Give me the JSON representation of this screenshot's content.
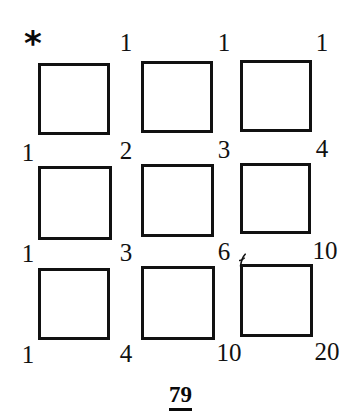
{
  "figure": {
    "caption": "79",
    "marker": "*",
    "marker_icon": "asterisk-icon",
    "grid": {
      "rows": 3,
      "columns": 3,
      "squares": [
        {
          "id": "square-r1c1",
          "x": 38,
          "y": 63,
          "size": 72
        },
        {
          "id": "square-r1c2",
          "x": 141,
          "y": 61,
          "size": 72
        },
        {
          "id": "square-r1c3",
          "x": 240,
          "y": 60,
          "size": 72
        },
        {
          "id": "square-r2c1",
          "x": 38,
          "y": 166,
          "size": 74
        },
        {
          "id": "square-r2c2",
          "x": 141,
          "y": 164,
          "size": 73
        },
        {
          "id": "square-r2c3",
          "x": 240,
          "y": 163,
          "size": 71
        },
        {
          "id": "square-r3c1",
          "x": 38,
          "y": 268,
          "size": 72
        },
        {
          "id": "square-r3c2",
          "x": 141,
          "y": 266,
          "size": 74
        },
        {
          "id": "square-r3c3",
          "x": 240,
          "y": 264,
          "size": 73
        }
      ]
    },
    "labels": [
      {
        "id": "label-r0c1",
        "text": "1",
        "x": 126,
        "y": 42
      },
      {
        "id": "label-r0c2",
        "text": "1",
        "x": 224,
        "y": 42
      },
      {
        "id": "label-r0c3",
        "text": "1",
        "x": 322,
        "y": 42
      },
      {
        "id": "label-r1c0",
        "text": "1",
        "x": 28,
        "y": 152
      },
      {
        "id": "label-r1c1",
        "text": "2",
        "x": 126,
        "y": 150
      },
      {
        "id": "label-r1c2",
        "text": "3",
        "x": 224,
        "y": 149
      },
      {
        "id": "label-r1c3",
        "text": "4",
        "x": 322,
        "y": 148
      },
      {
        "id": "label-r2c0",
        "text": "1",
        "x": 28,
        "y": 253
      },
      {
        "id": "label-r2c1",
        "text": "3",
        "x": 126,
        "y": 252
      },
      {
        "id": "label-r2c2",
        "text": "6",
        "x": 224,
        "y": 251
      },
      {
        "id": "label-r2c3",
        "text": "10",
        "x": 325,
        "y": 250
      },
      {
        "id": "label-r3c0",
        "text": "1",
        "x": 28,
        "y": 354
      },
      {
        "id": "label-r3c1",
        "text": "4",
        "x": 126,
        "y": 353
      },
      {
        "id": "label-r3c2",
        "text": "10",
        "x": 229,
        "y": 352
      },
      {
        "id": "label-r3c3",
        "text": "20",
        "x": 327,
        "y": 351
      }
    ],
    "marker_position": {
      "x": 33,
      "y": 43
    },
    "caption_position": {
      "y": 383
    },
    "colors": {
      "ink": "#111111",
      "background": "#ffffff"
    }
  },
  "chart_data": {
    "type": "table",
    "title": "79",
    "xlabel": "",
    "ylabel": "",
    "grid_labels": [
      [
        "",
        "1",
        "1",
        "1"
      ],
      [
        "1",
        "2",
        "3",
        "4"
      ],
      [
        "1",
        "3",
        "6",
        "10"
      ],
      [
        "1",
        "4",
        "10",
        "20"
      ]
    ],
    "corner_values": {
      "top_row": [
        "1",
        "1",
        "1"
      ],
      "second_row": [
        "1",
        "2",
        "3",
        "4"
      ],
      "third_row": [
        "1",
        "3",
        "6",
        "10"
      ],
      "bottom_row": [
        "1",
        "4",
        "10",
        "20"
      ]
    },
    "legend": [],
    "annotations": [
      {
        "text": "*",
        "position": "top-left"
      }
    ]
  }
}
